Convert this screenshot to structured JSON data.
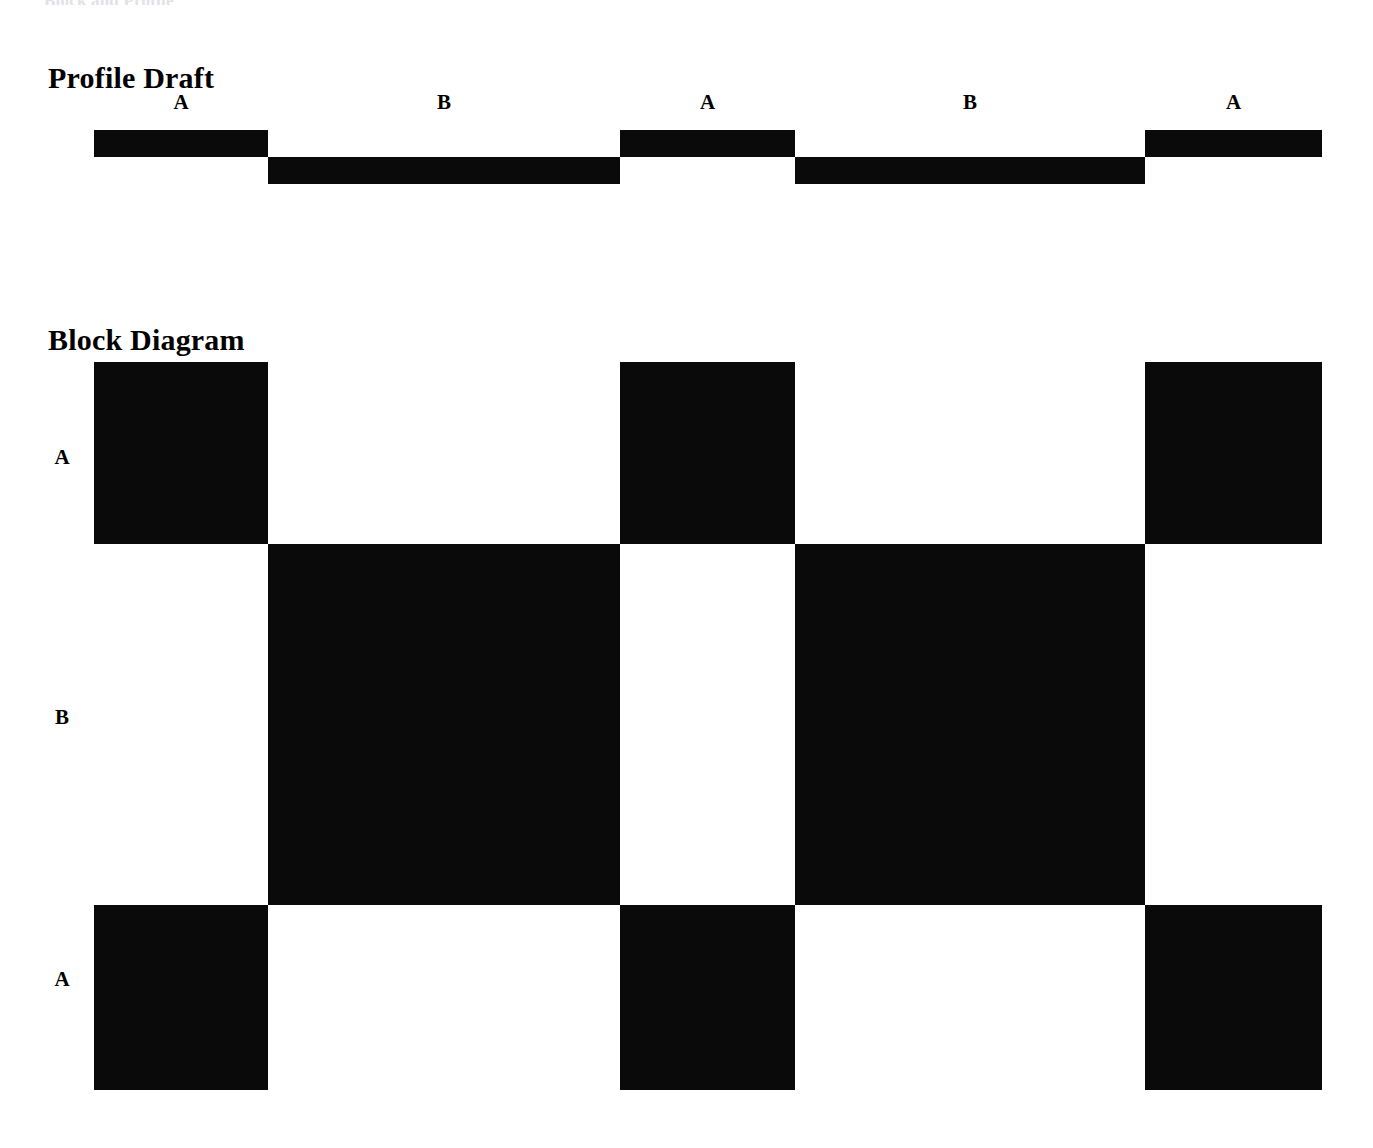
{
  "document": {
    "running_header": "Block and Profile",
    "background_color": "#ffffff",
    "ink_color": "#0a0a0a"
  },
  "sections": [
    {
      "id": "profile",
      "title": "Profile Draft"
    },
    {
      "id": "block",
      "title": "Block Diagram"
    }
  ],
  "profile": {
    "title": "Profile Draft",
    "segment_labels": [
      "A",
      "B",
      "A",
      "B",
      "A"
    ],
    "segment_levels": [
      "high",
      "low",
      "high",
      "low",
      "high"
    ],
    "boundaries_px": [
      94,
      268,
      620,
      795,
      1145,
      1322
    ],
    "label_centers_px": [
      181,
      444,
      707,
      970,
      1233
    ],
    "bar_thickness_px": 27,
    "high_top_px": 130,
    "low_top_px": 157
  },
  "block": {
    "title": "Block Diagram",
    "row_labels": [
      "A",
      "B",
      "A"
    ],
    "column_boundaries_px": [
      94,
      268,
      620,
      795,
      1145,
      1322
    ],
    "row_boundaries_px": [
      362,
      544,
      905,
      1090
    ],
    "row_label_centers_px": [
      458,
      718,
      980
    ],
    "grid": [
      [
        1,
        0,
        1,
        0,
        1
      ],
      [
        0,
        1,
        0,
        1,
        0
      ],
      [
        1,
        0,
        1,
        0,
        1
      ]
    ]
  },
  "chart_data": {
    "type": "bar",
    "xlabel": "",
    "ylabel": "",
    "charts": [
      {
        "type": "line",
        "name": "Profile Draft",
        "title": "Profile Draft",
        "description": "Two-level square-wave profile alternating between level A (high) and level B (low)",
        "categories": [
          "A",
          "B",
          "A",
          "B",
          "A"
        ],
        "values": [
          1,
          0,
          1,
          0,
          1
        ],
        "segment_extents_px": [
          [
            94,
            268
          ],
          [
            268,
            620
          ],
          [
            620,
            795
          ],
          [
            795,
            1145
          ],
          [
            1145,
            1322
          ]
        ],
        "segment_widths_px": [
          174,
          352,
          175,
          350,
          177
        ],
        "ylim": [
          0,
          1
        ],
        "grid": false,
        "legend": "none"
      },
      {
        "type": "heatmap",
        "name": "Block Diagram",
        "title": "Block Diagram",
        "description": "Three-row by five-column binary block grid; filled cells are black, empty cells are white",
        "rows": [
          "A",
          "B",
          "A"
        ],
        "columns": [
          "A",
          "B",
          "A",
          "B",
          "A"
        ],
        "values": [
          [
            1,
            0,
            1,
            0,
            1
          ],
          [
            0,
            1,
            0,
            1,
            0
          ],
          [
            1,
            0,
            1,
            0,
            1
          ]
        ],
        "colormap": {
          "0": "#ffffff",
          "1": "#0a0a0a"
        },
        "grid": false,
        "legend": "none"
      }
    ]
  }
}
